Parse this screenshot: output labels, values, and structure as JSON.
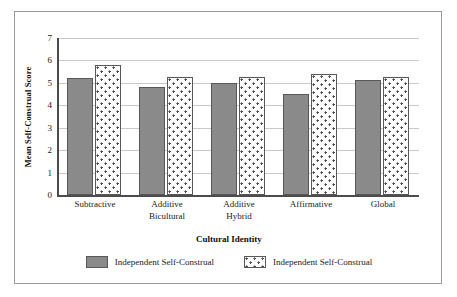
{
  "chart_data": {
    "type": "bar",
    "title": "",
    "xlabel": "Cultural Identity",
    "ylabel": "Mean Self-Construal Score",
    "ylim": [
      0,
      7
    ],
    "yticks": [
      0,
      1,
      2,
      3,
      4,
      5,
      6,
      7
    ],
    "ytick_labels": [
      "0",
      "1",
      "2",
      "3",
      "4",
      "5",
      "6",
      "7"
    ],
    "grid": true,
    "legend_position": "bottom",
    "categories": [
      "Subtractive",
      "Additive Bicultural",
      "Additive Hybrid",
      "Affirmative",
      "Global"
    ],
    "category_lines": [
      [
        "Subtractive"
      ],
      [
        "Additive",
        "Bicultural"
      ],
      [
        "Additive",
        "Hybrid"
      ],
      [
        "Affirmative"
      ],
      [
        "Global"
      ]
    ],
    "series": [
      {
        "name": "Independent Self-Construal",
        "fill": "solid-gray",
        "color": "#8a8a8a",
        "values": [
          5.2,
          4.8,
          5.0,
          4.5,
          5.15
        ]
      },
      {
        "name": "Independent Self-Construal",
        "fill": "white-dotted",
        "color": "#ffffff",
        "values": [
          5.8,
          5.25,
          5.25,
          5.4,
          5.25
        ]
      }
    ]
  },
  "figure": {
    "border_color": "#9a9a9a",
    "axis_color": "#4c4c4c",
    "gridline_color": "#c9c9c9"
  }
}
